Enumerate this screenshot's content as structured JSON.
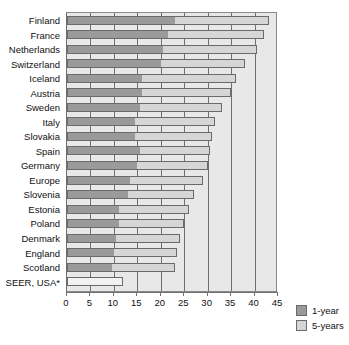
{
  "chart_data": {
    "type": "bar",
    "orientation": "horizontal",
    "stacked": true,
    "title": "",
    "xlabel": "",
    "ylabel": "",
    "xlim": [
      0,
      45
    ],
    "xticks": [
      0,
      5,
      10,
      15,
      20,
      25,
      30,
      35,
      40,
      45
    ],
    "grid": true,
    "legend_position": "right",
    "categories": [
      "Finland",
      "France",
      "Netherlands",
      "Switzerland",
      "Iceland",
      "Austria",
      "Sweden",
      "Italy",
      "Slovakia",
      "Spain",
      "Germany",
      "Europe",
      "Slovenia",
      "Estonia",
      "Poland",
      "Denmark",
      "England",
      "Scotland",
      "SEER, USA*"
    ],
    "series": [
      {
        "name": "1-year",
        "color": "#9a9a9a",
        "values": [
          23.0,
          21.5,
          20.5,
          20.0,
          16.0,
          16.0,
          15.5,
          14.5,
          14.5,
          15.5,
          15.0,
          13.5,
          13.0,
          11.0,
          11.0,
          10.5,
          10.0,
          9.5,
          0.0
        ]
      },
      {
        "name": "5-years",
        "color": "#d6d6d6",
        "values": [
          20.0,
          20.5,
          20.0,
          18.0,
          20.0,
          19.0,
          17.5,
          17.0,
          16.5,
          15.0,
          15.0,
          15.5,
          14.0,
          15.0,
          14.0,
          13.5,
          13.5,
          13.5,
          12.0
        ]
      }
    ],
    "totals": [
      43.0,
      42.0,
      40.5,
      38.0,
      36.0,
      35.0,
      33.0,
      31.5,
      31.0,
      30.5,
      30.0,
      29.0,
      27.0,
      26.0,
      25.0,
      24.0,
      23.5,
      23.0,
      12.0
    ],
    "outlined_categories": [
      "SEER, USA*"
    ]
  },
  "legend": {
    "items": [
      {
        "label": "1-year"
      },
      {
        "label": "5-years"
      }
    ]
  }
}
